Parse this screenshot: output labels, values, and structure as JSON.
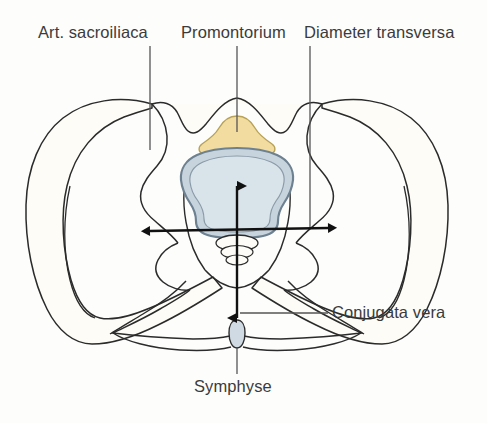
{
  "figure": {
    "background_color": "#fdfdfc"
  },
  "labels": {
    "sacroiliaca": "Art. sacroiliaca",
    "promontorium": "Promontorium",
    "transversa": "Diameter transversa",
    "conjugata": "Conjugata vera",
    "symphyse": "Symphyse"
  },
  "colors": {
    "outline": "#2b2b2b",
    "text": "#3b3b3b",
    "leader": "#555555",
    "bone_fill": "#fdfcf6",
    "promontorium_fill": "#f2dc9f",
    "promontorium_stroke": "#b8a257",
    "vertebra_fill": "#c7d4de",
    "vertebra_stroke": "#7d8f9c",
    "vertebra_inner_fill": "#d7e1e9",
    "symphysis_fill": "#cfdae2",
    "arrow_fill": "#111111"
  },
  "leader_lines": [
    {
      "name": "art-sacroiliaca",
      "x1": 150,
      "y1": 46,
      "x2": 150,
      "y2": 150
    },
    {
      "name": "promontorium",
      "x1": 237,
      "y1": 46,
      "x2": 237,
      "y2": 132
    },
    {
      "name": "diameter-transversa",
      "x1": 310,
      "y1": 46,
      "x2": 310,
      "y2": 228
    },
    {
      "name": "conjugata-vera",
      "x1": 240,
      "y1": 313,
      "x2": 328,
      "y2": 313
    },
    {
      "name": "symphyse",
      "x1": 237,
      "y1": 348,
      "x2": 237,
      "y2": 374
    }
  ],
  "measurement_arrows": [
    {
      "name": "diameter-transversa-arrow",
      "orientation": "horizontal",
      "double_headed": true,
      "x1": 148,
      "y1": 231,
      "x2": 330,
      "y2": 228
    },
    {
      "name": "conjugata-vera-arrow",
      "orientation": "vertical",
      "double_headed": true,
      "x1": 237,
      "y1": 186,
      "x2": 237,
      "y2": 318
    }
  ],
  "anatomy_parts": [
    {
      "name": "left-ilium",
      "label": "Art. sacroiliaca"
    },
    {
      "name": "right-ilium",
      "label": "Art. sacroiliaca"
    },
    {
      "name": "sacrum-promontorium",
      "label": "Promontorium"
    },
    {
      "name": "sacral-vertebral-body",
      "label": "Promontorium"
    },
    {
      "name": "coccyx",
      "label": ""
    },
    {
      "name": "pubic-symphysis",
      "label": "Symphyse"
    }
  ]
}
